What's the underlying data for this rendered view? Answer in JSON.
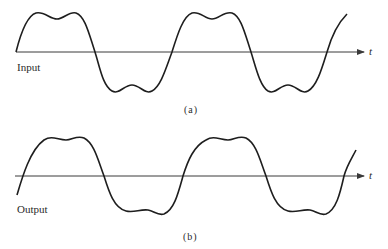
{
  "colors": {
    "background": "#ffffff",
    "stroke": "#1e1e1e",
    "axis": "#3a3a3a"
  },
  "panels": [
    {
      "id": "a",
      "signal_label": "Input",
      "caption": "(a)",
      "axis_variable": "t",
      "description": "Periodic waveform with flattened, double-humped peaks and troughs (fundamental plus third harmonic)"
    },
    {
      "id": "b",
      "signal_label": "Output",
      "caption": "(b)",
      "axis_variable": "t",
      "description": "Phase-shifted waveform with asymmetric tilted peaks and troughs"
    }
  ]
}
